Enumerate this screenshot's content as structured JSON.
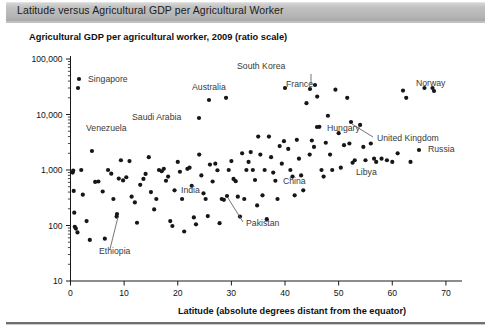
{
  "header": {
    "title": "Latitude versus Agricultural GDP per Agricultural Worker"
  },
  "chart_data": {
    "type": "scatter",
    "title": "Agricultural GDP per agricultural worker, 2009 (ratio scale)",
    "xlabel": "Latitude (absolute degrees distant from the equator)",
    "ylabel": "",
    "yscale": "log",
    "ylim": [
      10,
      100000
    ],
    "xlim": [
      0,
      73
    ],
    "grid": false,
    "legend": null,
    "xticks": [
      "0",
      "10",
      "20",
      "30",
      "40",
      "50",
      "60",
      "70"
    ],
    "xtick_values": [
      0,
      10,
      20,
      30,
      40,
      50,
      60,
      70
    ],
    "yticks": [
      "10",
      "100",
      "1,000",
      "10,000",
      "100,000"
    ],
    "ytick_values": [
      10,
      100,
      1000,
      10000,
      100000
    ],
    "points": [
      [
        0.4,
        900
      ],
      [
        0.5,
        980
      ],
      [
        0.6,
        420
      ],
      [
        0.7,
        170
      ],
      [
        0.8,
        95
      ],
      [
        1.0,
        88
      ],
      [
        1.3,
        75
      ],
      [
        1.4,
        30000
      ],
      [
        2.0,
        1000
      ],
      [
        2.3,
        360
      ],
      [
        3.0,
        120
      ],
      [
        3.6,
        55
      ],
      [
        4.0,
        2200
      ],
      [
        4.6,
        610
      ],
      [
        5.2,
        620
      ],
      [
        6.0,
        410
      ],
      [
        6.4,
        58
      ],
      [
        7.0,
        1000
      ],
      [
        7.6,
        860
      ],
      [
        8.0,
        300
      ],
      [
        8.6,
        145
      ],
      [
        9.0,
        700
      ],
      [
        9.4,
        1500
      ],
      [
        9.8,
        650
      ],
      [
        10.4,
        740
      ],
      [
        11.0,
        1450
      ],
      [
        11.4,
        330
      ],
      [
        12.0,
        260
      ],
      [
        12.4,
        112
      ],
      [
        13.0,
        540
      ],
      [
        13.6,
        690
      ],
      [
        14.0,
        850
      ],
      [
        14.6,
        1700
      ],
      [
        15.0,
        400
      ],
      [
        15.6,
        195
      ],
      [
        16.0,
        300
      ],
      [
        16.5,
        1000
      ],
      [
        17.0,
        950
      ],
      [
        17.4,
        1050
      ],
      [
        17.8,
        640
      ],
      [
        18.2,
        760
      ],
      [
        18.6,
        120
      ],
      [
        19.0,
        98
      ],
      [
        19.4,
        430
      ],
      [
        20.0,
        1400
      ],
      [
        20.4,
        930
      ],
      [
        20.8,
        300
      ],
      [
        21.2,
        78
      ],
      [
        21.8,
        1050
      ],
      [
        22.2,
        1100
      ],
      [
        22.6,
        520
      ],
      [
        23.0,
        140
      ],
      [
        23.4,
        105
      ],
      [
        24.0,
        1900
      ],
      [
        24.4,
        800
      ],
      [
        24.8,
        380
      ],
      [
        25.2,
        300
      ],
      [
        25.6,
        148
      ],
      [
        26.0,
        1250
      ],
      [
        26.5,
        620
      ],
      [
        27.0,
        1300
      ],
      [
        27.4,
        990
      ],
      [
        27.8,
        110
      ],
      [
        28.2,
        300
      ],
      [
        28.6,
        290
      ],
      [
        29.0,
        20000
      ],
      [
        29.5,
        1000
      ],
      [
        30.0,
        1450
      ],
      [
        30.4,
        690
      ],
      [
        30.8,
        630
      ],
      [
        31.2,
        330
      ],
      [
        31.6,
        145
      ],
      [
        32.0,
        2000
      ],
      [
        32.4,
        300
      ],
      [
        32.8,
        1000
      ],
      [
        33.2,
        1400
      ],
      [
        33.6,
        2100
      ],
      [
        34.0,
        1000
      ],
      [
        34.4,
        660
      ],
      [
        34.8,
        230
      ],
      [
        35.0,
        4000
      ],
      [
        35.4,
        1900
      ],
      [
        35.8,
        350
      ],
      [
        36.2,
        1000
      ],
      [
        36.6,
        130
      ],
      [
        37.0,
        4000
      ],
      [
        37.4,
        1700
      ],
      [
        37.8,
        900
      ],
      [
        38.2,
        640
      ],
      [
        38.6,
        300
      ],
      [
        39.0,
        2700
      ],
      [
        39.4,
        1300
      ],
      [
        39.8,
        3300
      ],
      [
        40.0,
        30000
      ],
      [
        40.6,
        2400
      ],
      [
        41.0,
        1000
      ],
      [
        41.4,
        760
      ],
      [
        41.8,
        350
      ],
      [
        42.2,
        3500
      ],
      [
        42.6,
        1600
      ],
      [
        43.0,
        800
      ],
      [
        43.4,
        430
      ],
      [
        44.0,
        16000
      ],
      [
        44.6,
        1900
      ],
      [
        45.0,
        3400
      ],
      [
        45.4,
        2600
      ],
      [
        46.0,
        21000
      ],
      [
        46.4,
        6000
      ],
      [
        46.8,
        1000
      ],
      [
        47.2,
        760
      ],
      [
        47.6,
        3100
      ],
      [
        48.0,
        9500
      ],
      [
        48.4,
        1900
      ],
      [
        48.8,
        1000
      ],
      [
        49.4,
        28000
      ],
      [
        50.0,
        4600
      ],
      [
        50.4,
        1100
      ],
      [
        51.0,
        2800
      ],
      [
        51.6,
        20000
      ],
      [
        52.0,
        3000
      ],
      [
        52.6,
        1350
      ],
      [
        53.0,
        1500
      ],
      [
        54.0,
        6500
      ],
      [
        54.6,
        2600
      ],
      [
        55.0,
        1500
      ],
      [
        56.0,
        3000
      ],
      [
        56.6,
        1600
      ],
      [
        57.0,
        1400
      ],
      [
        58.0,
        1600
      ],
      [
        59.0,
        1500
      ],
      [
        60.0,
        1400
      ],
      [
        61.0,
        2000
      ],
      [
        62.0,
        27000
      ],
      [
        62.6,
        20000
      ],
      [
        63.4,
        1400
      ],
      [
        66.0,
        30000
      ],
      [
        67.5,
        30000
      ]
    ],
    "annotations": [
      {
        "label": "Singapore",
        "label_x": 88,
        "label_y": 82,
        "point_x": 79,
        "point_y": 79,
        "leader": null
      },
      {
        "label": "Venezuela",
        "label_x": 86,
        "label_y": 131,
        "point_x": null,
        "point_y": null,
        "leader": null
      },
      {
        "label": "Saudi Arabia",
        "label_x": 132,
        "label_y": 120,
        "point_x": 199,
        "point_y": 118,
        "leader": null
      },
      {
        "label": "Australia",
        "label_x": 192,
        "label_y": 90,
        "point_x": 209,
        "point_y": 100,
        "leader": null
      },
      {
        "label": "South Korea",
        "label_x": 237,
        "label_y": 69,
        "point_x": 310,
        "point_y": 89,
        "leader": [
          311,
          74,
          311,
          85
        ]
      },
      {
        "label": "France",
        "label_x": 286,
        "label_y": 87,
        "point_x": 315,
        "point_y": 85,
        "leader": null
      },
      {
        "label": "Norway",
        "label_x": 416,
        "label_y": 86,
        "point_x": 434,
        "point_y": 91,
        "leader": null
      },
      {
        "label": "Hungary",
        "label_x": 327,
        "label_y": 131,
        "point_x": 317,
        "point_y": 127,
        "leader": null
      },
      {
        "label": "United Kingdom",
        "label_x": 377,
        "label_y": 141,
        "point_x": 351,
        "point_y": 122,
        "leader": [
          373,
          137,
          352,
          124
        ]
      },
      {
        "label": "Russia",
        "label_x": 428,
        "label_y": 152,
        "point_x": 419,
        "point_y": 150,
        "leader": null
      },
      {
        "label": "Libya",
        "label_x": 356,
        "label_y": 175,
        "point_x": null,
        "point_y": null,
        "leader": null
      },
      {
        "label": "China",
        "label_x": 283,
        "label_y": 184,
        "point_x": null,
        "point_y": null,
        "leader": null
      },
      {
        "label": "India",
        "label_x": 181,
        "label_y": 193,
        "point_x": null,
        "point_y": null,
        "leader": null
      },
      {
        "label": "Pakistan",
        "label_x": 246,
        "label_y": 226,
        "point_x": 227,
        "point_y": 196,
        "leader": [
          243,
          222,
          228,
          198
        ]
      },
      {
        "label": "Ethiopia",
        "label_x": 99,
        "label_y": 254,
        "point_x": 117,
        "point_y": 214,
        "leader": [
          110,
          249,
          118,
          217
        ]
      }
    ]
  },
  "icons": {}
}
